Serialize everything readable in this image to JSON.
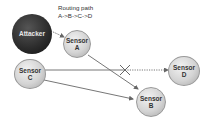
{
  "diagram": {
    "annotation": {
      "line1": "Routing path",
      "line2": "A->B->C->D"
    },
    "nodes": {
      "attacker": {
        "label": "Attacker"
      },
      "sensor_a": {
        "line1": "Sensor",
        "line2": "A"
      },
      "sensor_b": {
        "line1": "Sensor",
        "line2": "B"
      },
      "sensor_c": {
        "line1": "Sensor",
        "line2": "C"
      },
      "sensor_d": {
        "line1": "Sensor",
        "line2": "D"
      }
    },
    "edges": [
      {
        "from": "Attacker",
        "to": "Sensor A",
        "style": "dotted"
      },
      {
        "from": "Sensor A",
        "to": "Sensor B",
        "style": "solid"
      },
      {
        "from": "Sensor C",
        "to": "Sensor B",
        "style": "solid"
      },
      {
        "from": "Sensor C",
        "to": "Sensor D",
        "style": "solid-then-dotted",
        "blocked": true
      }
    ],
    "colors": {
      "sensor": "#d4d4d4",
      "attacker": "#2a2a2a",
      "edge": "#666666"
    }
  }
}
